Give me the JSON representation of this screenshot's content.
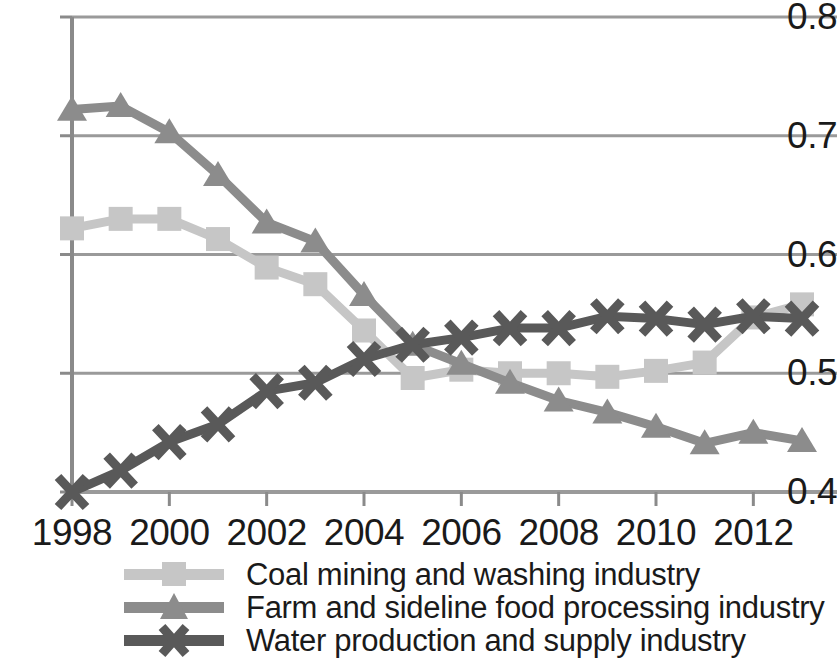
{
  "chart_data": {
    "type": "line",
    "title": "",
    "xlabel": "",
    "ylabel": "",
    "x": [
      1998,
      1999,
      2000,
      2001,
      2002,
      2003,
      2004,
      2005,
      2006,
      2007,
      2008,
      2009,
      2010,
      2011,
      2012,
      2013
    ],
    "xtick_labels": [
      "1998",
      "2000",
      "2002",
      "2004",
      "2006",
      "2008",
      "2010",
      "2012"
    ],
    "xticks": [
      1998,
      2000,
      2002,
      2004,
      2006,
      2008,
      2010,
      2012
    ],
    "ytick_labels": [
      "0.4",
      "0.5",
      "0.6",
      "0.7",
      "0.8"
    ],
    "yticks": [
      0.4,
      0.5,
      0.6,
      0.7,
      0.8
    ],
    "xlim": [
      1998,
      2013
    ],
    "ylim": [
      0.4,
      0.8
    ],
    "grid": "horizontal",
    "legend_position": "bottom",
    "series": [
      {
        "name": "Coal mining and washing industry",
        "marker": "square",
        "color": "#c6c6c6",
        "values": [
          0.622,
          0.63,
          0.63,
          0.613,
          0.589,
          0.575,
          0.536,
          0.496,
          0.503,
          0.5,
          0.5,
          0.497,
          0.502,
          0.509,
          0.547,
          0.558
        ]
      },
      {
        "name": "Farm and sideline food processing industry",
        "marker": "triangle",
        "color": "#8c8c8c",
        "values": [
          0.722,
          0.725,
          0.703,
          0.667,
          0.627,
          0.611,
          0.566,
          0.524,
          0.508,
          0.492,
          0.477,
          0.467,
          0.455,
          0.441,
          0.45,
          0.443
        ]
      },
      {
        "name": "Water production and supply industry",
        "marker": "cross",
        "color": "#595959",
        "values": [
          0.4,
          0.418,
          0.442,
          0.457,
          0.485,
          0.492,
          0.512,
          0.524,
          0.53,
          0.538,
          0.538,
          0.548,
          0.546,
          0.541,
          0.548,
          0.546
        ]
      }
    ]
  },
  "legend": {
    "items": [
      {
        "label": "Coal mining and washing industry"
      },
      {
        "label": "Farm and sideline food processing industry"
      },
      {
        "label": "Water production and supply industry"
      }
    ]
  },
  "colors": {
    "axis": "#8a8a8a",
    "grid": "#9a9a9a",
    "text": "#1a1a1a",
    "series1": "#c6c6c6",
    "series2": "#8c8c8c",
    "series3": "#595959"
  }
}
